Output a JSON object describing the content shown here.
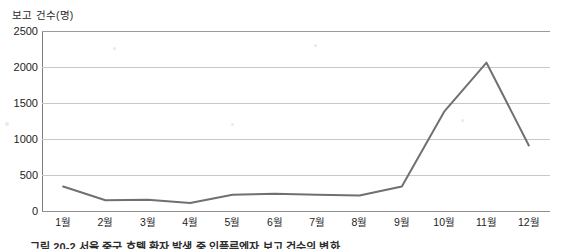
{
  "chart_data": {
    "type": "line",
    "title": "",
    "ylabel": "보고 건수(명)",
    "xlabel": "",
    "categories": [
      "1월",
      "2월",
      "3월",
      "4월",
      "5월",
      "6월",
      "7월",
      "8월",
      "9월",
      "10월",
      "11월",
      "12월"
    ],
    "values": [
      340,
      150,
      155,
      110,
      225,
      240,
      225,
      215,
      340,
      1380,
      2060,
      910
    ],
    "series": [
      {
        "name": "보고 건수",
        "values": [
          340,
          150,
          155,
          110,
          225,
          240,
          225,
          215,
          340,
          1380,
          2060,
          910
        ]
      }
    ],
    "ylim": [
      0,
      2500
    ],
    "yticks": [
      0,
      500,
      1000,
      1500,
      2000,
      2500
    ],
    "ytick_labels": [
      "0",
      "500",
      "1000",
      "1500",
      "2000",
      "2500"
    ],
    "grid": true,
    "legend": false,
    "legend_position": "none",
    "line_color": "#707070",
    "gridline_color": "#c8c8c8",
    "axis_color": "#7d7d7d",
    "background": "#ffffff"
  },
  "caption": {
    "text": "그림 20-2   서울 중구 호텔 환자 발생 중 인플루엔자 보고 건수의 변화"
  }
}
